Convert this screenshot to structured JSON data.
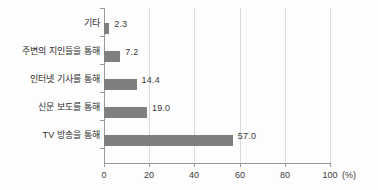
{
  "chart_data": {
    "type": "bar",
    "orientation": "horizontal",
    "title": "",
    "xlabel": "(%)",
    "ylabel": "",
    "xlim": [
      0,
      100
    ],
    "xticks": [
      0,
      20,
      40,
      60,
      80,
      100
    ],
    "xtick_labels": [
      "0",
      "20",
      "40",
      "60",
      "80",
      "100"
    ],
    "grid": "vertical",
    "legend": "none",
    "bar_color": "#7f7f7f",
    "categories": [
      "기타",
      "주변의 지인들을 통해",
      "인터넷 기사를 통해",
      "신문 보도를 통해",
      "TV 방송을 통해"
    ],
    "values": [
      2.3,
      7.2,
      14.4,
      19.0,
      57.0
    ],
    "value_labels": [
      "2.3",
      "7.2",
      "14.4",
      "19.0",
      "57.0"
    ]
  },
  "unit": "(%)"
}
